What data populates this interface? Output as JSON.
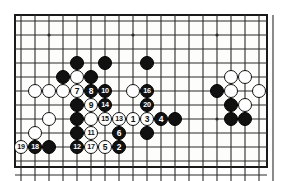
{
  "figure": {
    "kind": "go-board-diagram",
    "colors": {
      "black_stone": "#111111",
      "white_stone": "#ffffff",
      "grid_line": "#2b2b2b",
      "board_background": "#fdfdfb",
      "frame": "#1a1a1a",
      "page_background": "#ffffff"
    }
  },
  "board": {
    "cols": 18,
    "rows": 11,
    "cell": 14,
    "origin_x": 21,
    "origin_y": 21,
    "stone_diameter": 14,
    "frame": {
      "left": 14,
      "top": 14,
      "width": 254,
      "height": 154,
      "border": 2
    },
    "star_points": [
      {
        "col": 2,
        "row": 1
      },
      {
        "col": 8,
        "row": 1
      },
      {
        "col": 14,
        "row": 1
      },
      {
        "col": 8,
        "row": 7
      },
      {
        "col": 14,
        "row": 7
      }
    ]
  },
  "stones": [
    {
      "col": 4,
      "row": 3,
      "color": "black",
      "label": ""
    },
    {
      "col": 6,
      "row": 3,
      "color": "black",
      "label": ""
    },
    {
      "col": 9,
      "row": 3,
      "color": "black",
      "label": ""
    },
    {
      "col": 3,
      "row": 4,
      "color": "black",
      "label": ""
    },
    {
      "col": 4,
      "row": 4,
      "color": "white",
      "label": ""
    },
    {
      "col": 5,
      "row": 4,
      "color": "black",
      "label": ""
    },
    {
      "col": 1,
      "row": 5,
      "color": "white",
      "label": ""
    },
    {
      "col": 2,
      "row": 5,
      "color": "white",
      "label": ""
    },
    {
      "col": 3,
      "row": 5,
      "color": "white",
      "label": ""
    },
    {
      "col": 4,
      "row": 5,
      "color": "white",
      "label": "7"
    },
    {
      "col": 5,
      "row": 5,
      "color": "black",
      "label": "8"
    },
    {
      "col": 6,
      "row": 5,
      "color": "black",
      "label": "10"
    },
    {
      "col": 8,
      "row": 5,
      "color": "white",
      "label": ""
    },
    {
      "col": 9,
      "row": 5,
      "color": "black",
      "label": "16"
    },
    {
      "col": 4,
      "row": 6,
      "color": "black",
      "label": ""
    },
    {
      "col": 5,
      "row": 6,
      "color": "white",
      "label": "9"
    },
    {
      "col": 6,
      "row": 6,
      "color": "black",
      "label": "14"
    },
    {
      "col": 9,
      "row": 6,
      "color": "black",
      "label": "20"
    },
    {
      "col": 2,
      "row": 7,
      "color": "white",
      "label": ""
    },
    {
      "col": 4,
      "row": 7,
      "color": "black",
      "label": ""
    },
    {
      "col": 5,
      "row": 7,
      "color": "white",
      "label": ""
    },
    {
      "col": 6,
      "row": 7,
      "color": "white",
      "label": "15"
    },
    {
      "col": 7,
      "row": 7,
      "color": "white",
      "label": "13"
    },
    {
      "col": 8,
      "row": 7,
      "color": "white",
      "label": "1"
    },
    {
      "col": 9,
      "row": 7,
      "color": "white",
      "label": "3"
    },
    {
      "col": 10,
      "row": 7,
      "color": "black",
      "label": "4"
    },
    {
      "col": 11,
      "row": 7,
      "color": "black",
      "label": ""
    },
    {
      "col": 1,
      "row": 8,
      "color": "white",
      "label": ""
    },
    {
      "col": 4,
      "row": 8,
      "color": "black",
      "label": ""
    },
    {
      "col": 5,
      "row": 8,
      "color": "white",
      "label": "11"
    },
    {
      "col": 7,
      "row": 8,
      "color": "black",
      "label": "6"
    },
    {
      "col": 9,
      "row": 8,
      "color": "black",
      "label": ""
    },
    {
      "col": 0,
      "row": 9,
      "color": "white",
      "label": "19"
    },
    {
      "col": 1,
      "row": 9,
      "color": "black",
      "label": "18"
    },
    {
      "col": 2,
      "row": 9,
      "color": "black",
      "label": ""
    },
    {
      "col": 4,
      "row": 9,
      "color": "black",
      "label": "12"
    },
    {
      "col": 5,
      "row": 9,
      "color": "white",
      "label": "17"
    },
    {
      "col": 6,
      "row": 9,
      "color": "white",
      "label": "5"
    },
    {
      "col": 7,
      "row": 9,
      "color": "black",
      "label": "2"
    },
    {
      "col": 15,
      "row": 4,
      "color": "white",
      "label": ""
    },
    {
      "col": 16,
      "row": 4,
      "color": "white",
      "label": ""
    },
    {
      "col": 14,
      "row": 5,
      "color": "black",
      "label": ""
    },
    {
      "col": 15,
      "row": 5,
      "color": "white",
      "label": ""
    },
    {
      "col": 17,
      "row": 5,
      "color": "white",
      "label": ""
    },
    {
      "col": 15,
      "row": 6,
      "color": "black",
      "label": ""
    },
    {
      "col": 16,
      "row": 6,
      "color": "white",
      "label": ""
    },
    {
      "col": 15,
      "row": 7,
      "color": "black",
      "label": ""
    },
    {
      "col": 16,
      "row": 7,
      "color": "black",
      "label": ""
    }
  ]
}
